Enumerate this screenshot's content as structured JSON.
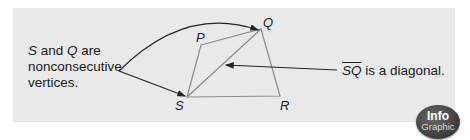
{
  "left_note": {
    "var1": "S",
    "text1": " and ",
    "var2": "Q",
    "text2": " are",
    "line2": "nonconsecutive",
    "line3": "vertices."
  },
  "right_note": {
    "segment": "SQ",
    "text": " is a diagonal."
  },
  "vertices": {
    "P": "P",
    "Q": "Q",
    "R": "R",
    "S": "S"
  },
  "badge": {
    "line1": "Info",
    "line2": "Graphic"
  },
  "colors": {
    "panel": "#e9e9e9",
    "polygon_stroke": "#8a8a8a",
    "arrow_stroke": "#222222"
  }
}
